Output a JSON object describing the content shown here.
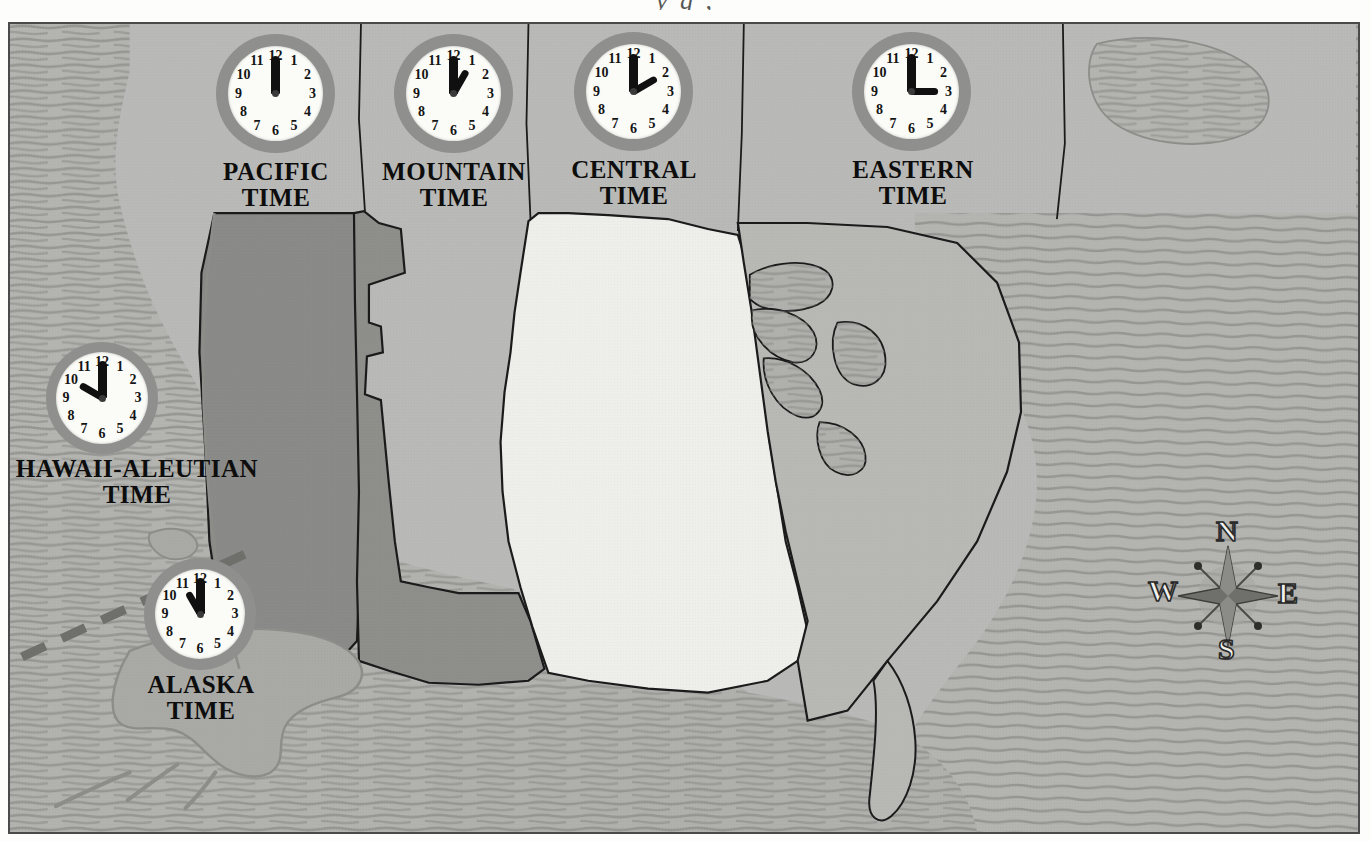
{
  "page": {
    "top_partial_text": "y                                     g          ,"
  },
  "map": {
    "background_color": "#b9b9b7",
    "frame_color": "#4a4a4a",
    "ocean_color": "#b4b4b1",
    "ocean_hatch_color": "#8d8d8a",
    "boundary_color": "#1b1b1b",
    "dateline_style": "dashed",
    "zones": [
      {
        "key": "hawaii-aleutian",
        "label": "HAWAII-ALEUTIAN\nTIME",
        "time": "10:00",
        "hour": 10,
        "minute": 0,
        "fill": "#b0b0ad"
      },
      {
        "key": "alaska",
        "label": "ALASKA\nTIME",
        "time": "11:00",
        "hour": 11,
        "minute": 0,
        "fill": "#a9a9a6"
      },
      {
        "key": "pacific",
        "label": "PACIFIC\nTIME",
        "time": "12:00",
        "hour": 12,
        "minute": 0,
        "fill": "#8a8a88"
      },
      {
        "key": "mountain",
        "label": "MOUNTAIN\nTIME",
        "time": "1:00",
        "hour": 1,
        "minute": 0,
        "fill": "#8e8e8b"
      },
      {
        "key": "central",
        "label": "CENTRAL\nTIME",
        "time": "2:00",
        "hour": 2,
        "minute": 0,
        "fill": "#eeeeea"
      },
      {
        "key": "eastern",
        "label": "EASTERN\nTIME",
        "time": "3:00",
        "hour": 3,
        "minute": 0,
        "fill": "#b8b8b5"
      }
    ]
  },
  "clock": {
    "numerals": [
      "12",
      "1",
      "2",
      "3",
      "4",
      "5",
      "6",
      "7",
      "8",
      "9",
      "10",
      "11"
    ],
    "bezel_color": "#8f8f8d",
    "face_color": "#fbfbf8",
    "hand_color": "#101010"
  },
  "compass": {
    "north": "N",
    "east": "E",
    "south": "S",
    "west": "W",
    "star_color": "#6f6f6c"
  }
}
